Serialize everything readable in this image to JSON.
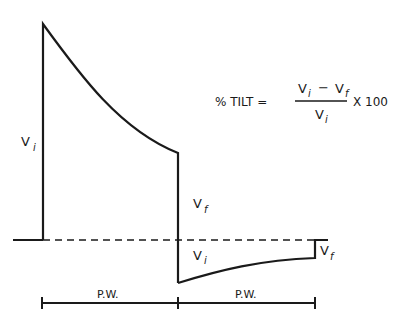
{
  "diagram": {
    "formula": {
      "lhs": "% TILT =",
      "numerator_a": "V",
      "numerator_a_sub": "i",
      "minus": "−",
      "numerator_b": "V",
      "numerator_b_sub": "f",
      "denominator": "V",
      "denominator_sub": "i",
      "multiplier": "X 100"
    },
    "labels": {
      "vi_left": "V",
      "vi_left_sub": "i",
      "vf_mid": "V",
      "vf_mid_sub": "f",
      "vi_neg": "V",
      "vi_neg_sub": "i",
      "vf_right": "V",
      "vf_right_sub": "f",
      "pw_left": "P.W.",
      "pw_right": "P.W."
    },
    "colors": {
      "line": "#1a1a1a",
      "background": "#ffffff"
    }
  }
}
